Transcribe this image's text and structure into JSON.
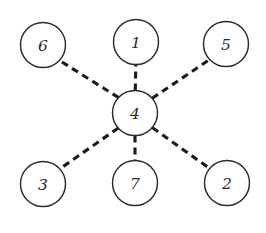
{
  "diagram": {
    "type": "node-link-graph",
    "background_color": "#ffffff",
    "node_fill_color": "#ffffff",
    "node_stroke_color": "#2b2b2b",
    "edge_color": "#1b1b1b",
    "label_color": "#2b2b2b",
    "edge_style": "dashed",
    "edge_dash_pattern": "7 5",
    "edge_width": 3.1,
    "node_radius": 22.5,
    "node_stroke_width": 1.45,
    "nodes": [
      {
        "id": "n6",
        "label": "6",
        "cx": 43,
        "cy": 45,
        "r": 22.5
      },
      {
        "id": "n1",
        "label": "1",
        "cx": 136,
        "cy": 42,
        "r": 22.5
      },
      {
        "id": "n5",
        "label": "5",
        "cx": 226,
        "cy": 44,
        "r": 22.5
      },
      {
        "id": "n4",
        "label": "4",
        "cx": 135,
        "cy": 113,
        "r": 22.5
      },
      {
        "id": "n3",
        "label": "3",
        "cx": 43,
        "cy": 184,
        "r": 22.5
      },
      {
        "id": "n7",
        "label": "7",
        "cx": 135,
        "cy": 183,
        "r": 22.5
      },
      {
        "id": "n2",
        "label": "2",
        "cx": 227,
        "cy": 183,
        "r": 22.5
      }
    ],
    "hub_node_id": "n4",
    "edges": [
      {
        "id": "e-4-6",
        "from": "n4",
        "to": "n6",
        "x1": 118.6,
        "y1": 97.6,
        "x2": 59.4,
        "y2": 60.4
      },
      {
        "id": "e-4-1",
        "from": "n4",
        "to": "n1",
        "x1": 135.3,
        "y1": 90.5,
        "x2": 135.8,
        "y2": 64.5
      },
      {
        "id": "e-4-5",
        "from": "n4",
        "to": "n5",
        "x1": 152.2,
        "y1": 98.3,
        "x2": 209.2,
        "y2": 59.8
      },
      {
        "id": "e-4-3",
        "from": "n4",
        "to": "n3",
        "x1": 118.3,
        "y1": 128.0,
        "x2": 60.2,
        "y2": 168.6
      },
      {
        "id": "e-4-7",
        "from": "n4",
        "to": "n7",
        "x1": 135.0,
        "y1": 135.5,
        "x2": 135.0,
        "y2": 160.5
      },
      {
        "id": "e-4-2",
        "from": "n4",
        "to": "n2",
        "x1": 152.5,
        "y1": 127.8,
        "x2": 209.6,
        "y2": 168.4
      }
    ]
  }
}
